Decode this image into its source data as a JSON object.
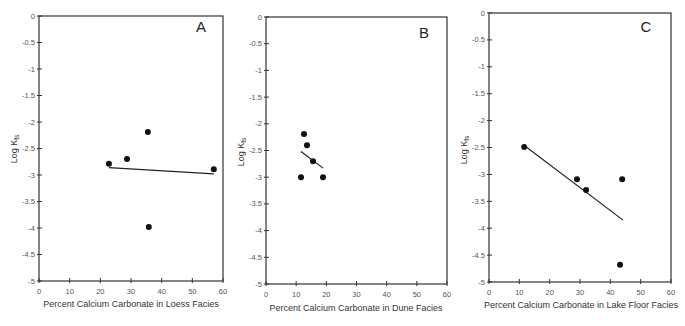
{
  "chart_data": [
    {
      "type": "scatter",
      "panel": "A",
      "title": "",
      "xlabel": "Percent Calcium Carbonate in Loess Facies",
      "ylabel": "Log K_fs",
      "xlim": [
        0,
        60
      ],
      "ylim": [
        -5,
        0
      ],
      "xticks": [
        0,
        10,
        20,
        30,
        40,
        50,
        60
      ],
      "yticks": [
        0,
        -0.5,
        -1,
        -1.5,
        -2,
        -2.5,
        -3,
        -3.5,
        -4,
        -4.5,
        -5
      ],
      "grid": false,
      "points": [
        {
          "x": 22.8,
          "y": -2.79
        },
        {
          "x": 28.7,
          "y": -2.7
        },
        {
          "x": 35.5,
          "y": -2.19
        },
        {
          "x": 35.8,
          "y": -3.98
        },
        {
          "x": 57.0,
          "y": -2.89
        }
      ],
      "trendline": {
        "x": [
          22.8,
          57.0
        ],
        "y": [
          -2.86,
          -2.98
        ]
      }
    },
    {
      "type": "scatter",
      "panel": "B",
      "title": "",
      "xlabel": "Percent Calcium Carbonate in Dune Facies",
      "ylabel": "Log K_fs",
      "xlim": [
        0,
        60
      ],
      "ylim": [
        -5,
        0
      ],
      "xticks": [
        0,
        10,
        20,
        30,
        40,
        50,
        60
      ],
      "yticks": [
        0,
        -0.5,
        -1,
        -1.5,
        -2,
        -2.5,
        -3,
        -3.5,
        -4,
        -4.5,
        -5
      ],
      "grid": false,
      "points": [
        {
          "x": 12.6,
          "y": -2.19
        },
        {
          "x": 13.6,
          "y": -2.4
        },
        {
          "x": 15.6,
          "y": -2.7
        },
        {
          "x": 11.6,
          "y": -3.0
        },
        {
          "x": 18.9,
          "y": -3.0
        }
      ],
      "trendline": {
        "x": [
          11.6,
          18.9
        ],
        "y": [
          -2.52,
          -2.83
        ]
      }
    },
    {
      "type": "scatter",
      "panel": "C",
      "title": "",
      "xlabel": "Percent Calcium Carbonate in Lake Floor Facies",
      "ylabel": "Log K_fs",
      "xlim": [
        0,
        60
      ],
      "ylim": [
        -5,
        0
      ],
      "xticks": [
        0,
        10,
        20,
        30,
        40,
        50,
        60
      ],
      "yticks": [
        0,
        -0.5,
        -1,
        -1.5,
        -2,
        -2.5,
        -3,
        -3.5,
        -4,
        -4.5,
        -5
      ],
      "grid": false,
      "points": [
        {
          "x": 11.6,
          "y": -2.49
        },
        {
          "x": 29.0,
          "y": -3.09
        },
        {
          "x": 32.0,
          "y": -3.29
        },
        {
          "x": 43.9,
          "y": -3.09
        },
        {
          "x": 43.2,
          "y": -4.68
        }
      ],
      "trendline": {
        "x": [
          12.5,
          44.2
        ],
        "y": [
          -2.5,
          -3.85
        ]
      }
    }
  ],
  "panels": [
    {
      "letter": "A",
      "ylabel_main": "Log K",
      "ylabel_sub": "fs",
      "xlabel": "Percent Calcium Carbonate in Loess Facies"
    },
    {
      "letter": "B",
      "ylabel_main": "Log K",
      "ylabel_sub": "fs",
      "xlabel": "Percent Calcium Carbonate in Dune Facies"
    },
    {
      "letter": "C",
      "ylabel_main": "Log K",
      "ylabel_sub": "fs",
      "xlabel": "Percent Calcium Carbonate in Lake Floor Facies"
    }
  ],
  "colors": {
    "axis": "#333333",
    "point": "#111111",
    "line": "#222222",
    "tick_text": "#555555"
  }
}
